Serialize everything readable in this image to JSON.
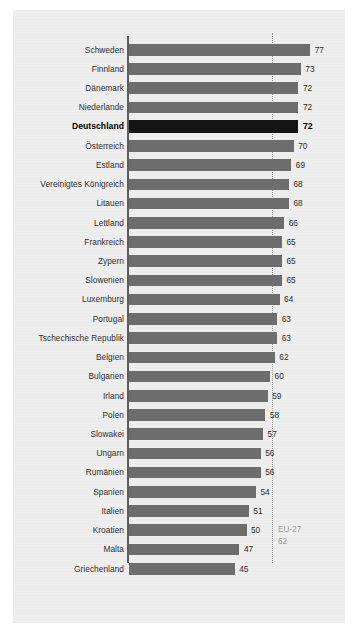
{
  "chart_data": {
    "type": "bar",
    "orientation": "horizontal",
    "title": "",
    "subtitle": "",
    "xlabel": "",
    "ylabel": "",
    "xlim": [
      0,
      80
    ],
    "grid": false,
    "legend": "none",
    "highlight_category": "Deutschland",
    "reference_line": {
      "label": "EU-27",
      "value": "62",
      "value_number": 62,
      "style": "dotted"
    },
    "colors": {
      "bar": "#6d6d6d",
      "bar_highlight": "#141414",
      "panel_background": "#eeeeee",
      "page_background": "#ffffff",
      "axis": "#5d5d5d",
      "reference_line": "#9b9b9b",
      "reference_label": "#9a9a9a",
      "label_text": "#2e2e2e"
    },
    "categories": [
      "Schweden",
      "Finnland",
      "Dänemark",
      "Niederlande",
      "Deutschland",
      "Österreich",
      "Estland",
      "Vereinigtes Königreich",
      "Litauen",
      "Lettland",
      "Frankreich",
      "Zypern",
      "Slowenien",
      "Luxemburg",
      "Portugal",
      "Tschechische Republik",
      "Belgien",
      "Bulgarien",
      "Irland",
      "Polen",
      "Slowakei",
      "Ungarn",
      "Rumänien",
      "Spanien",
      "Italien",
      "Kroatien",
      "Malta",
      "Griechenland"
    ],
    "values": [
      77,
      73,
      72,
      72,
      72,
      70,
      69,
      68,
      68,
      66,
      65,
      65,
      65,
      64,
      63,
      63,
      62,
      60,
      59,
      58,
      57,
      56,
      56,
      54,
      51,
      50,
      47,
      45
    ],
    "value_labels": [
      "77",
      "73",
      "72",
      "72",
      "72",
      "70",
      "69",
      "68",
      "68",
      "66",
      "65",
      "65",
      "65",
      "64",
      "63",
      "63",
      "62",
      "60",
      "59",
      "58",
      "57",
      "56",
      "56",
      "54",
      "51",
      "50",
      "47",
      "45"
    ]
  }
}
